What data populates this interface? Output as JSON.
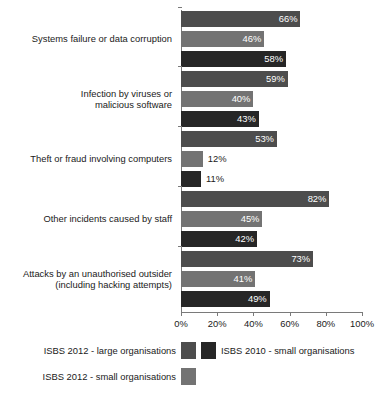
{
  "chart_data": {
    "type": "bar",
    "orientation": "horizontal",
    "title": "",
    "subtitle": "",
    "xlabel": "",
    "ylabel": "",
    "xlim": [
      0,
      100
    ],
    "xticks": [
      "0%",
      "20%",
      "40%",
      "60%",
      "80%",
      "100%"
    ],
    "xtick_values": [
      0,
      20,
      40,
      60,
      80,
      100
    ],
    "grid": false,
    "legend_position": "bottom",
    "categories": [
      "Systems failure or data corruption",
      "Infection by viruses or\nmalicious software",
      "Theft or fraud involving computers",
      "Other incidents caused by staff",
      "Attacks by an unauthorised outsider\n(including hacking attempts)"
    ],
    "series": [
      {
        "name": "ISBS 2012 - large organisations",
        "color": "#4d4d4d",
        "values": [
          66,
          59,
          53,
          82,
          73
        ],
        "labels": [
          "66%",
          "59%",
          "53%",
          "82%",
          "73%"
        ]
      },
      {
        "name": "ISBS 2012 - small organisations",
        "color": "#737373",
        "values": [
          46,
          40,
          12,
          45,
          41
        ],
        "labels": [
          "46%",
          "40%",
          "12%",
          "45%",
          "41%"
        ]
      },
      {
        "name": "ISBS 2010 - small organisations",
        "color": "#262626",
        "values": [
          58,
          43,
          11,
          42,
          49
        ],
        "labels": [
          "58%",
          "43%",
          "11%",
          "42%",
          "49%"
        ]
      }
    ]
  },
  "legend": {
    "entries": [
      {
        "label": "ISBS 2012 - large organisations",
        "color": "#4d4d4d"
      },
      {
        "label": "ISBS 2010 - small organisations",
        "color": "#262626"
      },
      {
        "label": "ISBS 2012 - small organisations",
        "color": "#737373"
      }
    ]
  }
}
